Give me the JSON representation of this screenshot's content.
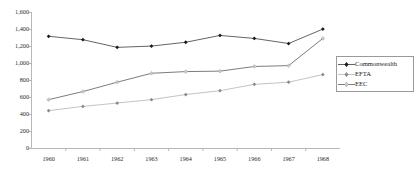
{
  "chart_data": {
    "type": "line",
    "title": "",
    "subtitle": "",
    "xlabel": "",
    "ylabel": "",
    "categories": [
      "1960",
      "1961",
      "1962",
      "1963",
      "1964",
      "1965",
      "1966",
      "1967",
      "1968"
    ],
    "x": [
      1960,
      1961,
      1962,
      1963,
      1964,
      1965,
      1966,
      1967,
      1968
    ],
    "ylim": [
      0,
      1600
    ],
    "ytick_labels": [
      "0",
      "200",
      "400",
      "600",
      "800",
      "1,000",
      "1,200",
      "1,400",
      "1,600"
    ],
    "ytick_values": [
      0,
      200,
      400,
      600,
      800,
      1000,
      1200,
      1400,
      1600
    ],
    "grid": false,
    "legend_position": "right",
    "series": [
      {
        "name": "Commonwealth",
        "marker": "diamond",
        "color": "#3c3c3c",
        "marker_color": "#1a1a1a",
        "values": [
          1320,
          1280,
          1190,
          1205,
          1250,
          1330,
          1295,
          1235,
          1405
        ]
      },
      {
        "name": "EFTA",
        "marker": "diamond",
        "color": "#b4b4b4",
        "marker_color": "#8c8c8c",
        "values": [
          445,
          495,
          535,
          575,
          635,
          680,
          755,
          780,
          870
        ]
      },
      {
        "name": "EEC",
        "marker": "diamond",
        "color": "#5a5a5a",
        "marker_color": "#c8c8c8",
        "values": [
          575,
          670,
          780,
          885,
          905,
          910,
          965,
          975,
          1295
        ]
      }
    ]
  },
  "legend": {
    "items": [
      {
        "label": "Commonwealth",
        "key_icon": "line-with-diamond-marker-icon"
      },
      {
        "label": "EFTA",
        "key_icon": "line-with-diamond-marker-icon"
      },
      {
        "label": "EEC",
        "key_icon": "line-with-diamond-marker-icon"
      }
    ]
  }
}
